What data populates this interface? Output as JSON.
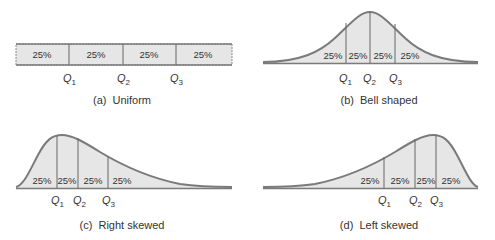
{
  "colors": {
    "fill": "#e6e6e6",
    "stroke": "#7a7a7a",
    "text": "#333333"
  },
  "panels": [
    {
      "id": "a",
      "caption": "(a)  Uniform",
      "percents": [
        "25%",
        "25%",
        "25%",
        "25%"
      ],
      "quartiles": [
        {
          "q": "Q",
          "sub": "1"
        },
        {
          "q": "Q",
          "sub": "2"
        },
        {
          "q": "Q",
          "sub": "3"
        }
      ]
    },
    {
      "id": "b",
      "caption": "(b)  Bell shaped",
      "percents": [
        "25%",
        "25%",
        "25%",
        "25%"
      ],
      "quartiles": [
        {
          "q": "Q",
          "sub": "1"
        },
        {
          "q": "Q",
          "sub": "2"
        },
        {
          "q": "Q",
          "sub": "3"
        }
      ]
    },
    {
      "id": "c",
      "caption": "(c)  Right skewed",
      "percents": [
        "25%",
        "25%",
        "25%",
        "25%"
      ],
      "quartiles": [
        {
          "q": "Q",
          "sub": "1"
        },
        {
          "q": "Q",
          "sub": "2"
        },
        {
          "q": "Q",
          "sub": "3"
        }
      ]
    },
    {
      "id": "d",
      "caption": "(d)  Left skewed",
      "percents": [
        "25%",
        "25%",
        "25%",
        "25%"
      ],
      "quartiles": [
        {
          "q": "Q",
          "sub": "1"
        },
        {
          "q": "Q",
          "sub": "2"
        },
        {
          "q": "Q",
          "sub": "3"
        }
      ]
    }
  ]
}
